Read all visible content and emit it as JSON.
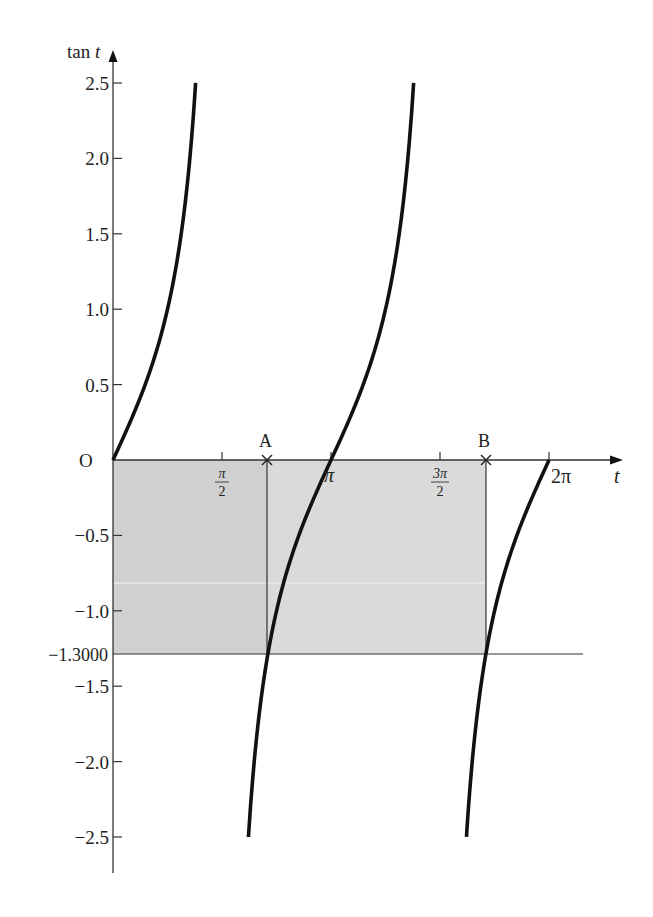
{
  "chart_data": {
    "type": "line",
    "title": "",
    "function": "tan t",
    "xlabel": "t",
    "ylabel": "tan t",
    "xlim": [
      0,
      6.4
    ],
    "ylim": [
      -2.5,
      2.5
    ],
    "grid": false,
    "legend": null,
    "x_ticks": [
      {
        "value": 1.5708,
        "label_num": "π",
        "label_den": "2"
      },
      {
        "value": 3.1416,
        "label": "π"
      },
      {
        "value": 4.7124,
        "label_num": "3π",
        "label_den": "2"
      },
      {
        "value": 6.2832,
        "label": "2π"
      }
    ],
    "origin_label": "O",
    "y_ticks": [
      {
        "value": 2.5,
        "label": "2.5"
      },
      {
        "value": 2.0,
        "label": "2.0"
      },
      {
        "value": 1.5,
        "label": "1.5"
      },
      {
        "value": 1.0,
        "label": "1.0"
      },
      {
        "value": 0.5,
        "label": "0.5"
      },
      {
        "value": 0,
        "label": "0"
      },
      {
        "value": -0.5,
        "label": "−0.5"
      },
      {
        "value": -1.0,
        "label": "−1.0"
      },
      {
        "value": -1.5,
        "label": "−1.5"
      },
      {
        "value": -2.0,
        "label": "−2.0"
      },
      {
        "value": -2.5,
        "label": "−2.5"
      }
    ],
    "series": [
      {
        "name": "tan t branch 1",
        "t_range": [
          0,
          1.1903
        ],
        "x": [
          0,
          0.3,
          0.6,
          0.9,
          1.1903
        ],
        "y": [
          0,
          0.31,
          0.68,
          1.26,
          2.5
        ]
      },
      {
        "name": "tan t branch 2",
        "t_range": [
          1.9513,
          4.3319
        ],
        "x": [
          1.9513,
          2.2265,
          2.6,
          3.1416,
          3.6,
          4.0,
          4.3319
        ],
        "y": [
          -2.5,
          -1.3,
          -0.6,
          0,
          0.49,
          1.16,
          2.5
        ]
      },
      {
        "name": "tan t branch 3",
        "t_range": [
          5.0929,
          6.2832
        ],
        "x": [
          5.0929,
          5.3681,
          5.7,
          6.0,
          6.2832
        ],
        "y": [
          -2.5,
          -1.3,
          -0.65,
          -0.29,
          0
        ]
      }
    ],
    "annotations": [
      {
        "type": "hline",
        "y": -1.3,
        "label": "−1.3000",
        "x_range": [
          0,
          6.8
        ]
      },
      {
        "type": "point",
        "label": "A",
        "x": 2.2265,
        "y": 0,
        "marker": "x"
      },
      {
        "type": "point",
        "label": "B",
        "x": 5.3681,
        "y": 0,
        "marker": "x"
      },
      {
        "type": "vline",
        "x": 2.2265,
        "y_range": [
          -1.3,
          0
        ]
      },
      {
        "type": "vline",
        "x": 5.3681,
        "y_range": [
          -1.3,
          0
        ]
      },
      {
        "type": "shaded-rect",
        "x_range": [
          0,
          2.2265
        ],
        "y_range": [
          -1.3,
          0
        ],
        "color": "#d0d0d0"
      },
      {
        "type": "shaded-rect",
        "x_range": [
          2.2265,
          5.3681
        ],
        "y_range": [
          -1.3,
          0
        ],
        "color": "#dadada"
      }
    ]
  },
  "labels": {
    "y_axis": "tan t",
    "y_axis_prefix": "tan",
    "y_axis_var": "t",
    "x_axis": "t",
    "origin": "O",
    "point_a": "A",
    "point_b": "B",
    "hline_value": "−1.3000",
    "tick_pi_half_num": "π",
    "tick_pi_half_den": "2",
    "tick_pi": "π",
    "tick_three_pi_half_num": "3π",
    "tick_three_pi_half_den": "2",
    "tick_two_pi": "2π"
  },
  "colors": {
    "curve": "#111111",
    "axis": "#333333",
    "shade_left": "#d0d0d0",
    "shade_right": "#dadada"
  }
}
